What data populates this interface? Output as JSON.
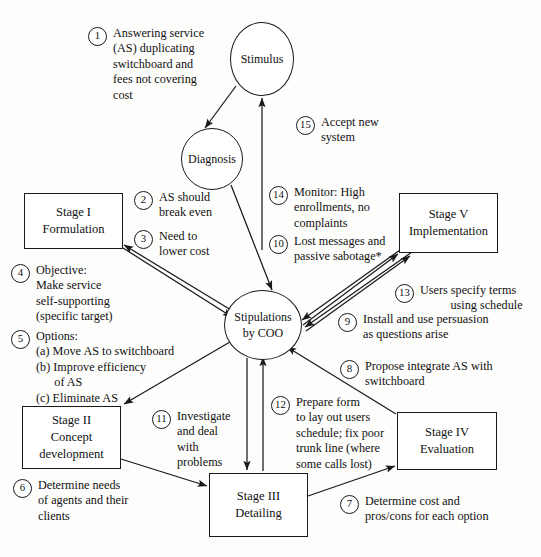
{
  "diagram": {
    "type": "flow-diagram",
    "nodes": [
      {
        "id": "stimulus",
        "shape": "circle",
        "lines": [
          "Stimulus"
        ]
      },
      {
        "id": "diagnosis",
        "shape": "circle",
        "lines": [
          "Diagnosis"
        ]
      },
      {
        "id": "stipulations",
        "shape": "circle",
        "lines": [
          "Stipulations",
          "by COO"
        ]
      },
      {
        "id": "stage1",
        "shape": "box",
        "lines": [
          "Stage I",
          "Formulation"
        ]
      },
      {
        "id": "stage2",
        "shape": "box",
        "lines": [
          "Stage II",
          "Concept",
          "development"
        ]
      },
      {
        "id": "stage3",
        "shape": "box",
        "lines": [
          "Stage III",
          "Detailing"
        ]
      },
      {
        "id": "stage4",
        "shape": "box",
        "lines": [
          "Stage IV",
          "Evaluation"
        ]
      },
      {
        "id": "stage5",
        "shape": "box",
        "lines": [
          "Stage V",
          "Implementation"
        ]
      }
    ],
    "annotations": [
      {
        "num": "1",
        "text": "Answering service\n(AS) duplicating\nswitchboard and\nfees not covering\ncost"
      },
      {
        "num": "2",
        "text": "AS should\nbreak even"
      },
      {
        "num": "3",
        "text": "Need to\nlower cost"
      },
      {
        "num": "4",
        "text": "Objective:\nMake service\nself-supporting\n(specific target)"
      },
      {
        "num": "5",
        "text": "Options:\n(a) Move AS to switchboard\n(b) Improve efficiency\n      of AS\n(c) Eliminate AS"
      },
      {
        "num": "6",
        "text": "Determine needs\nof agents and their\nclients"
      },
      {
        "num": "7",
        "text": "Determine cost and\npros/cons for each option"
      },
      {
        "num": "8",
        "text": "Propose integrate AS with\nswitchboard"
      },
      {
        "num": "9",
        "text": "Install and use persuasion\nas questions arise"
      },
      {
        "num": "10",
        "text": "Lost messages and\npassive sabotage*"
      },
      {
        "num": "11",
        "text": "Investigate\nand deal\nwith\nproblems"
      },
      {
        "num": "12",
        "text": "Prepare form\nto lay out users\nschedule; fix poor\ntrunk line (where\nsome calls lost)"
      },
      {
        "num": "13",
        "text": "Users specify terms\n          using schedule"
      },
      {
        "num": "14",
        "text": "Monitor: High\nenrollments, no\ncomplaints"
      },
      {
        "num": "15",
        "text": "Accept new\nsystem"
      }
    ],
    "colors": {
      "stroke": "#1a1a1a",
      "background": "#fdfdfc",
      "text": "#111111"
    }
  }
}
